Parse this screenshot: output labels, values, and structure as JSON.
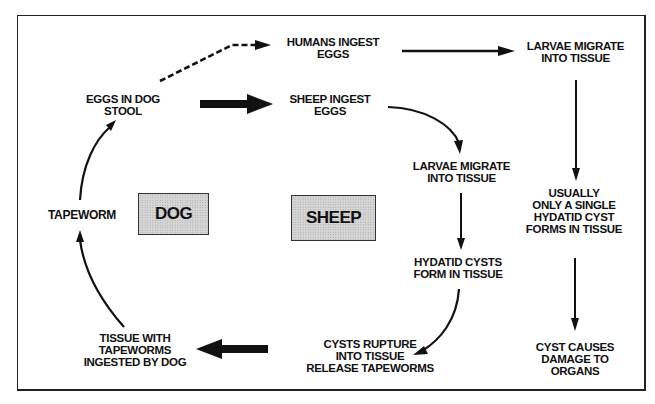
{
  "diagram": {
    "hosts": {
      "dog": "DOG",
      "sheep": "SHEEP"
    },
    "nodes": {
      "humans_ingest": [
        "HUMANS INGEST",
        "EGGS"
      ],
      "larvae_top": [
        "LARVAE MIGRATE",
        "INTO TISSUE"
      ],
      "eggs_stool": [
        "EGGS IN DOG",
        "STOOL"
      ],
      "sheep_ingest": [
        "SHEEP INGEST",
        "EGGS"
      ],
      "larvae_mid": [
        "LARVAE MIGRATE",
        "INTO TISSUE"
      ],
      "tapeworm": [
        "TAPEWORM"
      ],
      "single_cyst": [
        "USUALLY",
        "ONLY A SINGLE",
        "HYDATID CYST",
        "FORMS IN TISSUE"
      ],
      "hydatid_cysts": [
        "HYDATID CYSTS",
        "FORM IN TISSUE"
      ],
      "tissue_ingested": [
        "TISSUE WITH",
        "TAPEWORMS",
        "INGESTED BY DOG"
      ],
      "cysts_rupture": [
        "CYSTS RUPTURE",
        "INTO TISSUE",
        "RELEASE TAPEWORMS"
      ],
      "cyst_damage": [
        "CYST CAUSES",
        "DAMAGE TO",
        "ORGANS"
      ]
    },
    "edges": [
      {
        "from": "eggs_stool",
        "to": "humans_ingest",
        "style": "dashed"
      },
      {
        "from": "humans_ingest",
        "to": "larvae_top",
        "style": "solid"
      },
      {
        "from": "larvae_top",
        "to": "single_cyst",
        "style": "solid"
      },
      {
        "from": "single_cyst",
        "to": "cyst_damage",
        "style": "solid"
      },
      {
        "from": "eggs_stool",
        "to": "sheep_ingest",
        "style": "bold"
      },
      {
        "from": "sheep_ingest",
        "to": "larvae_mid",
        "style": "curved"
      },
      {
        "from": "larvae_mid",
        "to": "hydatid_cysts",
        "style": "solid"
      },
      {
        "from": "hydatid_cysts",
        "to": "cysts_rupture",
        "style": "curved"
      },
      {
        "from": "cysts_rupture",
        "to": "tissue_ingested",
        "style": "bold"
      },
      {
        "from": "tissue_ingested",
        "to": "tapeworm",
        "style": "curved"
      },
      {
        "from": "tapeworm",
        "to": "eggs_stool",
        "style": "curved"
      }
    ],
    "colors": {
      "ink": "#111111",
      "box_fill": "#d6d6d6",
      "background": "#ffffff"
    }
  }
}
